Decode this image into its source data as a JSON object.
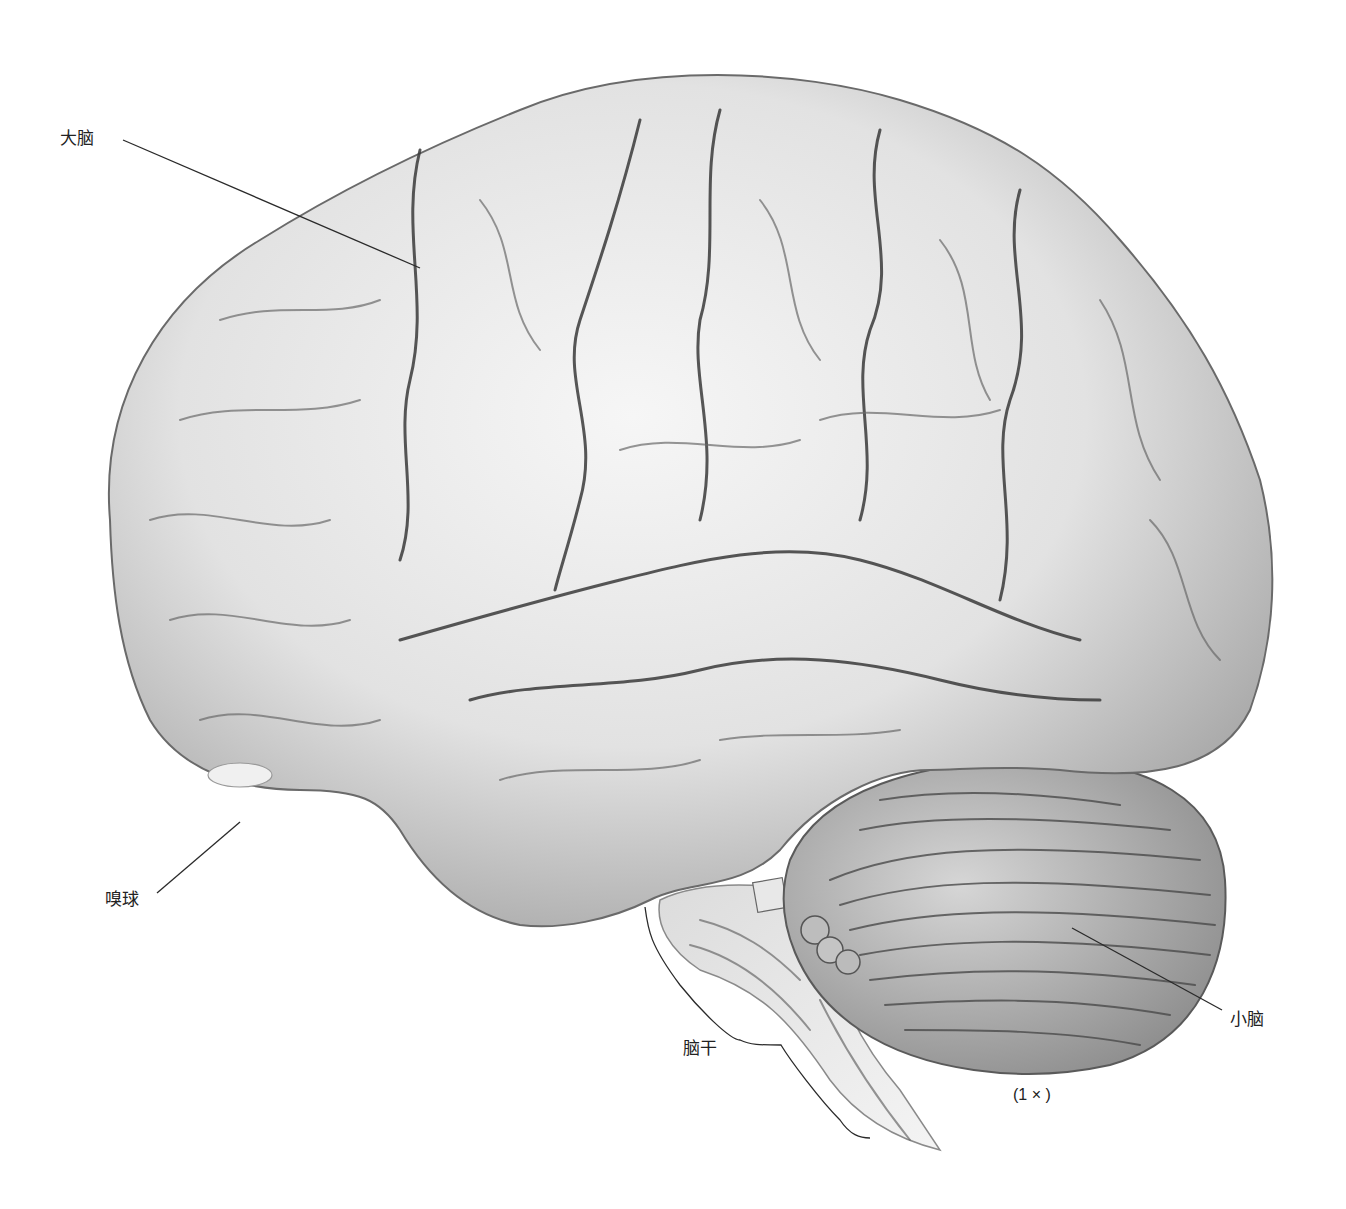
{
  "figure": {
    "scale_note": "(1 × )",
    "labels": [
      {
        "id": "cerebrum",
        "text": "大脑"
      },
      {
        "id": "olfactory-bulb",
        "text": "嗅球"
      },
      {
        "id": "brainstem",
        "text": "脑干"
      },
      {
        "id": "cerebellum",
        "text": "小脑"
      }
    ],
    "colors": {
      "background": "#ffffff",
      "cortex_light": "#f2f2f2",
      "cortex_mid": "#c9c9c9",
      "cortex_shadow": "#7a7a7a",
      "line": "#2a2a2a"
    }
  }
}
